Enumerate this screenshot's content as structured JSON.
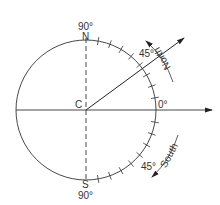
{
  "diagram": {
    "center_label": "C",
    "top_label": "N",
    "top_angle": "90°",
    "bottom_label": "S",
    "bottom_angle": "90°",
    "zero_label": "0°",
    "upper_angle": "45°",
    "lower_angle": "45°",
    "north_arc_label": "North",
    "south_arc_label": "South",
    "colors": {
      "stroke": "#333333",
      "background": "#ffffff"
    }
  }
}
